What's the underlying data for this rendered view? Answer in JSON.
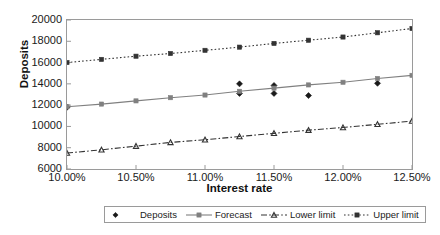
{
  "chart_data": {
    "type": "line",
    "title": "",
    "xlabel": "Interest rate",
    "ylabel": "Deposits",
    "x": [
      10.0,
      10.25,
      10.5,
      10.75,
      11.0,
      11.25,
      11.5,
      11.75,
      12.0,
      12.25,
      12.5
    ],
    "x_tick_labels": [
      "10.00%",
      "10.50%",
      "11.00%",
      "11.50%",
      "12.00%",
      "12.50%"
    ],
    "x_tick_values": [
      10.0,
      10.5,
      11.0,
      11.5,
      12.0,
      12.5
    ],
    "xlim": [
      10.0,
      12.5
    ],
    "y_tick_labels": [
      "20000",
      "18000",
      "16000",
      "14000",
      "12000",
      "10000",
      "8000",
      "6000"
    ],
    "y_tick_values": [
      20000,
      18000,
      16000,
      14000,
      12000,
      10000,
      8000,
      6000
    ],
    "ylim": [
      6000,
      20000
    ],
    "grid": false,
    "legend_position": "bottom",
    "series": [
      {
        "name": "Deposits",
        "style": "scatter",
        "marker": "diamond",
        "color": "#1a1a1a",
        "x": [
          10.0,
          11.25,
          11.25,
          11.5,
          11.5,
          11.75,
          12.25
        ],
        "values": [
          11800,
          14000,
          13100,
          13850,
          13100,
          12900,
          14050
        ]
      },
      {
        "name": "Forecast",
        "style": "solid-line",
        "marker": "square",
        "color": "#808080",
        "values": [
          11850,
          12100,
          12400,
          12700,
          12950,
          13300,
          13600,
          13900,
          14150,
          14500,
          14800
        ]
      },
      {
        "name": "Lower limit",
        "style": "dash-dot-line",
        "marker": "triangle",
        "color": "#333333",
        "values": [
          7500,
          7800,
          8150,
          8500,
          8750,
          9050,
          9350,
          9650,
          9900,
          10200,
          10500
        ]
      },
      {
        "name": "Upper limit",
        "style": "dotted-line",
        "marker": "square",
        "color": "#333333",
        "values": [
          16000,
          16300,
          16600,
          16850,
          17150,
          17450,
          17800,
          18100,
          18400,
          18800,
          19200
        ]
      }
    ]
  },
  "legend": {
    "items": [
      {
        "label": "Deposits"
      },
      {
        "label": "Forecast"
      },
      {
        "label": "Lower limit"
      },
      {
        "label": "Upper limit"
      }
    ]
  }
}
